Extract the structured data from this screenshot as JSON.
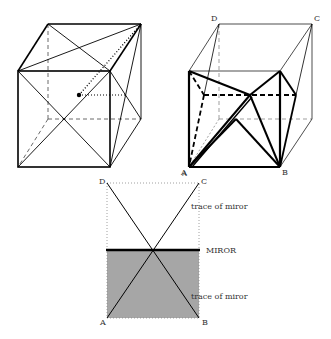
{
  "figure": {
    "left_cube": {
      "description": "cube with face diagonals and dotted line from center point"
    },
    "right_cube": {
      "labels": {
        "D": "D",
        "C": "C",
        "A": "A",
        "B": "B"
      }
    },
    "bottom_diagram": {
      "labels": {
        "D": "D",
        "C": "C",
        "A": "A",
        "B": "B",
        "A_top": "A",
        "C_stray": "C",
        "trace_upper": "trace of miror",
        "trace_lower": "trace of miror",
        "mirror": "MIROR"
      },
      "colors": {
        "mirror_fill": "#a6a6a6",
        "mirror_line": "#000000"
      }
    }
  }
}
